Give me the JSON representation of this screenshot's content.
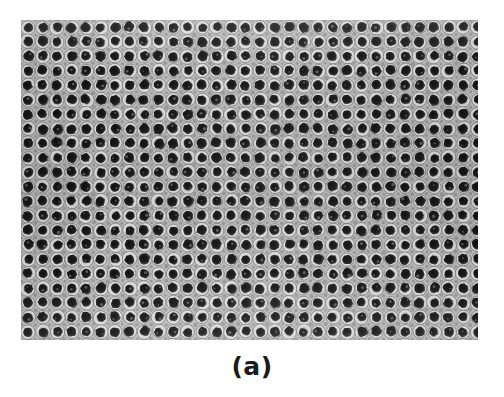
{
  "figure": {
    "caption": "(a)",
    "panel_label": "a",
    "image_type": "sem-micrograph"
  },
  "micrograph": {
    "x": 21,
    "y": 20,
    "width": 457,
    "height": 320,
    "colors": {
      "pore_dark": "#1c1c1c",
      "pore_core": "#111111",
      "wall_light": "#e2e2e2",
      "wall_mid": "#9a9a9a",
      "background_gray": "#b9b9b9",
      "page_background": "#ffffff",
      "caption_text": "#1a1a1a"
    },
    "lattice": {
      "type": "square",
      "pitch_x": 14.5,
      "pitch_y": 14.5,
      "row_offset_x": 0,
      "pore_radius": 5.0,
      "ring_radius": 7.0,
      "columns": 33,
      "rows": 23
    }
  },
  "chart_data": {
    "type": "heatmap",
    "title": "(a)",
    "xlabel": "",
    "ylabel": "",
    "categories": [],
    "values": [],
    "legend": [],
    "grid": false
  }
}
